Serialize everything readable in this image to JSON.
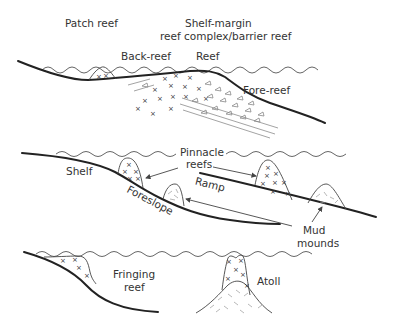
{
  "diagram": {
    "panels": [
      {
        "id": "shelf-margin",
        "labels": {
          "patch_reef": "Patch reef",
          "shelf_margin_line1": "Shelf-margin",
          "shelf_margin_line2": "reef complex/barrier reef",
          "back_reef": "Back-reef",
          "reef": "Reef",
          "fore_reef": "Fore-reef"
        }
      },
      {
        "id": "shelf-and-ramp",
        "labels": {
          "shelf": "Shelf",
          "pinnacle_line1": "Pinnacle",
          "pinnacle_line2": "reefs",
          "ramp": "Ramp",
          "foreslope": "Foreslope",
          "mud_line1": "Mud",
          "mud_line2": "mounds"
        }
      },
      {
        "id": "fringing-and-atoll",
        "labels": {
          "fringing_line1": "Fringing",
          "fringing_line2": "reef",
          "atoll": "Atoll"
        }
      }
    ],
    "symbols": {
      "reef_framework": "×",
      "reef_debris": "△"
    }
  }
}
